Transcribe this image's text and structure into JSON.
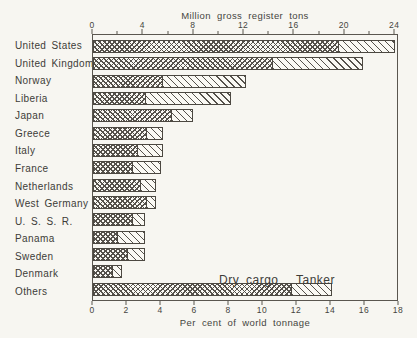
{
  "figure": {
    "top_axis_title": "Million gross register tons",
    "bottom_axis_title": "Per cent of world tonnage",
    "legend": {
      "dry_cargo": "Dry cargo",
      "tanker": "Tanker"
    }
  },
  "colors": {
    "paper": "#f7f6f1",
    "ink": "#3b3b3b",
    "bar_outline": "#4c4841",
    "hatch": "#55514b"
  },
  "chart_data": {
    "type": "bar",
    "orientation": "horizontal",
    "stacked": true,
    "title": "Million gross register tons",
    "categories": [
      "United States",
      "United Kingdom",
      "Norway",
      "Liberia",
      "Japan",
      "Greece",
      "Italy",
      "France",
      "Netherlands",
      "West Germany",
      "U. S. S. R.",
      "Panama",
      "Sweden",
      "Denmark",
      "Others"
    ],
    "series": [
      {
        "name": "Dry cargo",
        "pattern": "crosshatch",
        "values": [
          19.7,
          14.4,
          5.6,
          4.2,
          6.3,
          4.3,
          3.6,
          3.2,
          3.8,
          4.3,
          3.2,
          2.0,
          2.8,
          1.6,
          15.9
        ]
      },
      {
        "name": "Tanker",
        "pattern": "diagonal-hatch",
        "values": [
          4.5,
          7.3,
          6.7,
          6.9,
          1.8,
          1.4,
          2.1,
          2.3,
          1.3,
          0.8,
          1.0,
          2.2,
          1.4,
          0.8,
          3.3
        ]
      }
    ],
    "top_axis": {
      "label": "Million gross register tons",
      "range": [
        0,
        24
      ],
      "major_ticks": [
        0,
        4,
        8,
        12,
        16,
        20,
        24
      ],
      "minor_ticks": [
        2,
        6,
        10,
        14,
        18,
        22
      ]
    },
    "bottom_axis": {
      "label": "Per cent of world tonnage",
      "range": [
        0,
        18
      ],
      "major_ticks": [
        0,
        2,
        4,
        6,
        8,
        10,
        12,
        14,
        16,
        18
      ]
    },
    "legend_position": "inline-above-last-bar",
    "grid": false
  }
}
